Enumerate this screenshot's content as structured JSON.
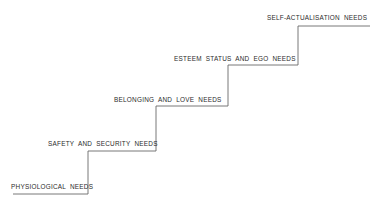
{
  "diagram": {
    "type": "staircase",
    "line_color": "#6a6a6a",
    "text_color": "#2a2a2a",
    "steps": [
      {
        "label": "PHYSIOLOGICAL NEEDS"
      },
      {
        "label": "SAFETY AND  SECURITY NEEDS"
      },
      {
        "label": "BELONGING  AND  LOVE  NEEDS"
      },
      {
        "label": "ESTEEM  STATUS  AND  EGO  NEEDS"
      },
      {
        "label": "SELF-ACTUALISATION  NEEDS"
      }
    ]
  }
}
